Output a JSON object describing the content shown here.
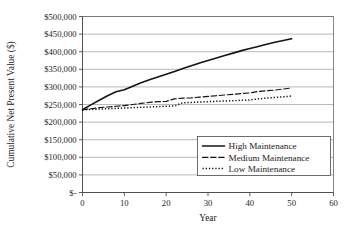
{
  "chart_data": {
    "type": "line",
    "title": "",
    "xlabel": "Year",
    "ylabel": "Cumulative Net Present Value ($)",
    "xlim": [
      0,
      60
    ],
    "ylim": [
      0,
      500000
    ],
    "xticks": [
      0,
      10,
      20,
      30,
      40,
      50,
      60
    ],
    "xtick_labels": [
      "0",
      "10",
      "20",
      "30",
      "40",
      "50",
      "60"
    ],
    "yticks": [
      0,
      50000,
      100000,
      150000,
      200000,
      250000,
      300000,
      350000,
      400000,
      450000,
      500000
    ],
    "ytick_labels": [
      "$-",
      "$50,000",
      "$100,000",
      "$150,000",
      "$200,000",
      "$250,000",
      "$300,000",
      "$350,000",
      "$400,000",
      "$450,000",
      "$500,000"
    ],
    "grid": true,
    "grid_axis": "y",
    "legend_position": "lower-right",
    "x": [
      0,
      2,
      4,
      6,
      8,
      10,
      12,
      14,
      16,
      18,
      20,
      22,
      24,
      26,
      28,
      30,
      32,
      34,
      36,
      38,
      40,
      42,
      44,
      46,
      48,
      50
    ],
    "series": [
      {
        "name": "High Maintenance",
        "style": "solid",
        "color": "#141414",
        "values": [
          235000,
          249000,
          262000,
          275000,
          286000,
          292000,
          302000,
          312000,
          320000,
          328000,
          336000,
          344000,
          352000,
          360000,
          368000,
          375000,
          382000,
          389000,
          396000,
          403000,
          409000,
          415000,
          421000,
          427000,
          432000,
          437000
        ]
      },
      {
        "name": "Medium Maintenance",
        "style": "dashed",
        "color": "#141414",
        "values": [
          235000,
          238000,
          241000,
          243000,
          245000,
          247000,
          250000,
          253000,
          256000,
          258000,
          259000,
          266000,
          268000,
          269000,
          271000,
          273000,
          275000,
          277000,
          279000,
          281000,
          283000,
          287000,
          289000,
          291000,
          294000,
          297000
        ]
      },
      {
        "name": "Low Maintenance",
        "style": "dotted",
        "color": "#141414",
        "values": [
          235000,
          236000,
          237000,
          238000,
          239000,
          240000,
          241000,
          242000,
          243000,
          244000,
          245000,
          246000,
          255000,
          256000,
          257000,
          258000,
          259000,
          260000,
          261000,
          262000,
          263000,
          266000,
          268000,
          270000,
          272000,
          274000
        ]
      }
    ]
  },
  "legend": {
    "entries": [
      {
        "label": "High Maintenance",
        "style": "solid"
      },
      {
        "label": "Medium Maintenance",
        "style": "dashed"
      },
      {
        "label": "Low Maintenance",
        "style": "dotted"
      }
    ]
  }
}
